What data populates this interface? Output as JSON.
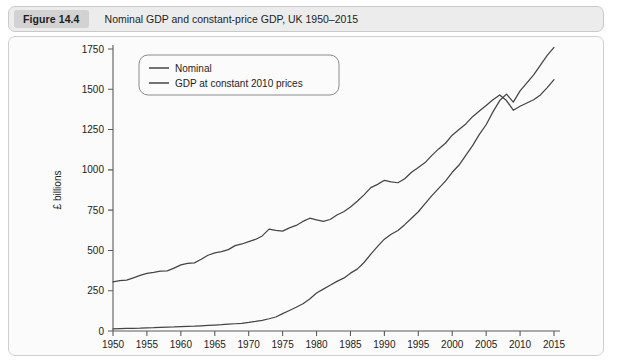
{
  "figure": {
    "badge": "Figure 14.4",
    "title": "Nominal GDP and constant-price GDP, UK 1950–2015"
  },
  "chart_data": {
    "type": "line",
    "title": "Nominal GDP and constant-price GDP, UK 1950–2015",
    "xlabel": "",
    "ylabel": "£ billions",
    "xlim": [
      1950,
      2015
    ],
    "ylim": [
      0,
      1750
    ],
    "xticks": [
      1950,
      1955,
      1960,
      1965,
      1970,
      1975,
      1980,
      1985,
      1990,
      1995,
      2000,
      2005,
      2010,
      2015
    ],
    "yticks": [
      0,
      250,
      500,
      750,
      1000,
      1250,
      1500,
      1750
    ],
    "grid": false,
    "legend_position": "top-left",
    "legend": [
      "Nominal",
      "GDP at constant 2010 prices"
    ],
    "x": [
      1950,
      1951,
      1952,
      1953,
      1954,
      1955,
      1956,
      1957,
      1958,
      1959,
      1960,
      1961,
      1962,
      1963,
      1964,
      1965,
      1966,
      1967,
      1968,
      1969,
      1970,
      1971,
      1972,
      1973,
      1974,
      1975,
      1976,
      1977,
      1978,
      1979,
      1980,
      1981,
      1982,
      1983,
      1984,
      1985,
      1986,
      1987,
      1988,
      1989,
      1990,
      1991,
      1992,
      1993,
      1994,
      1995,
      1996,
      1997,
      1998,
      1999,
      2000,
      2001,
      2002,
      2003,
      2004,
      2005,
      2006,
      2007,
      2008,
      2009,
      2010,
      2011,
      2012,
      2013,
      2014,
      2015
    ],
    "series": [
      {
        "name": "Nominal",
        "values": [
          13,
          14,
          16,
          17,
          18,
          20,
          21,
          23,
          24,
          25,
          27,
          29,
          30,
          32,
          35,
          37,
          39,
          42,
          45,
          48,
          53,
          59,
          66,
          76,
          87,
          108,
          127,
          147,
          169,
          199,
          236,
          260,
          284,
          308,
          328,
          359,
          384,
          425,
          477,
          525,
          570,
          600,
          624,
          660,
          700,
          740,
          790,
          840,
          885,
          930,
          985,
          1030,
          1090,
          1150,
          1220,
          1280,
          1360,
          1430,
          1470,
          1420,
          1490,
          1540,
          1590,
          1650,
          1710,
          1760
        ]
      },
      {
        "name": "GDP at constant 2010 prices",
        "values": [
          305,
          312,
          316,
          330,
          345,
          358,
          364,
          372,
          373,
          390,
          410,
          420,
          423,
          445,
          470,
          485,
          492,
          505,
          530,
          540,
          555,
          568,
          590,
          632,
          625,
          620,
          640,
          655,
          680,
          700,
          690,
          680,
          692,
          720,
          740,
          770,
          805,
          845,
          890,
          910,
          935,
          925,
          920,
          945,
          985,
          1015,
          1045,
          1090,
          1130,
          1165,
          1215,
          1250,
          1285,
          1330,
          1365,
          1400,
          1435,
          1465,
          1430,
          1370,
          1395,
          1415,
          1435,
          1465,
          1510,
          1560
        ]
      }
    ]
  }
}
